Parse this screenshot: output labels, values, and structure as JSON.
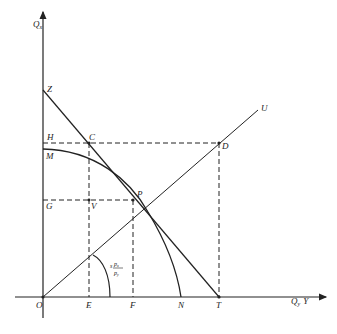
{
  "diagram": {
    "type": "production-possibility / trade diagram",
    "axes": {
      "y_label": "Q",
      "y_sub": "x",
      "x_label": "Q",
      "x_sub": "y",
      "x_extra": "Y",
      "origin": "O"
    },
    "points": {
      "Z": "Z",
      "H": "H",
      "C": "C",
      "D": "D",
      "M": "M",
      "P": "P",
      "G": "G",
      "V": "V",
      "U": "U",
      "E": "E",
      "F": "F",
      "N": "N",
      "T": "T"
    },
    "angle_label": {
      "prefix": "s",
      "numerator": "p",
      "num_sub": "x",
      "denominator": "p",
      "den_sub": "y"
    },
    "colors": {
      "line": "#222222",
      "background": "#ffffff"
    }
  }
}
